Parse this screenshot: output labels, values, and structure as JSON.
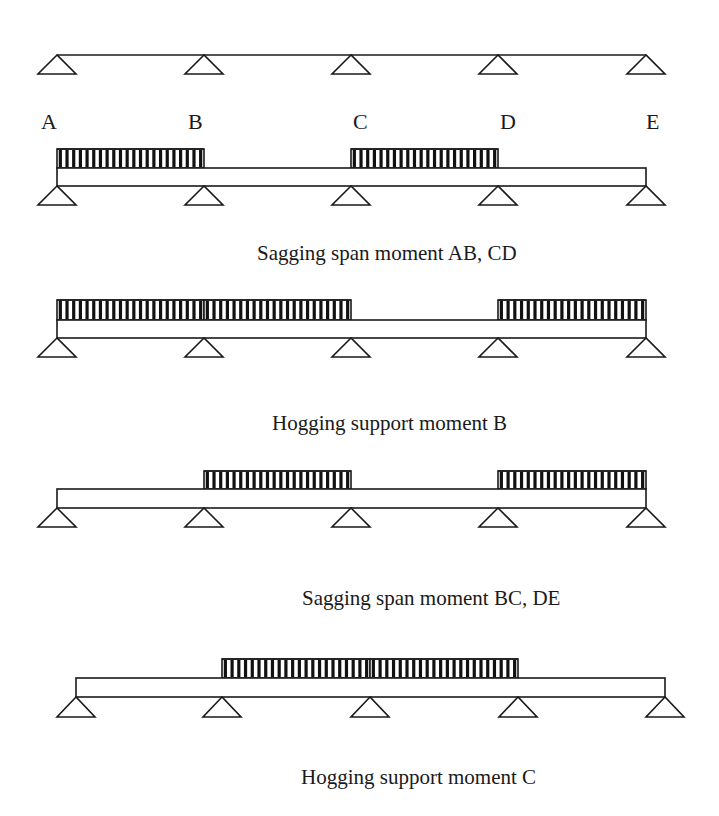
{
  "figure": {
    "width": 719,
    "height": 816,
    "line_color": "#1a1a1a",
    "background": "#ffffff"
  },
  "reference_beam": {
    "y": 55,
    "x_start": 57,
    "x_end": 646,
    "supports_x": [
      57,
      204,
      351,
      498,
      646
    ],
    "support_height": 19,
    "support_half_base": 19
  },
  "node_labels": [
    {
      "text": "A",
      "x": 41,
      "y": 129
    },
    {
      "text": "B",
      "x": 188,
      "y": 129
    },
    {
      "text": "C",
      "x": 353,
      "y": 129
    },
    {
      "text": "D",
      "x": 500,
      "y": 129
    },
    {
      "text": "E",
      "x": 646,
      "y": 129
    }
  ],
  "load_cases": [
    {
      "name": "sagging-AB-CD",
      "caption": "Sagging span moment AB, CD",
      "caption_x": 257,
      "caption_y": 260,
      "beam": {
        "x_start": 57,
        "x_end": 646,
        "y_top": 168,
        "y_bottom": 186
      },
      "load_top": 149,
      "supports_x": [
        57,
        204,
        351,
        498,
        646
      ],
      "support_height": 19,
      "support_half_base": 19,
      "loaded_spans": [
        {
          "span": "AB",
          "x_start": 57,
          "x_end": 204
        },
        {
          "span": "CD",
          "x_start": 351,
          "x_end": 498
        }
      ]
    },
    {
      "name": "hogging-B",
      "caption": "Hogging support moment B",
      "caption_x": 272,
      "caption_y": 430,
      "beam": {
        "x_start": 57,
        "x_end": 646,
        "y_top": 320,
        "y_bottom": 338
      },
      "load_top": 300,
      "supports_x": [
        57,
        204,
        351,
        498,
        646
      ],
      "support_height": 19,
      "support_half_base": 19,
      "loaded_spans": [
        {
          "span": "AB",
          "x_start": 57,
          "x_end": 204
        },
        {
          "span": "BC",
          "x_start": 204,
          "x_end": 351
        },
        {
          "span": "DE",
          "x_start": 498,
          "x_end": 646
        }
      ]
    },
    {
      "name": "sagging-BC-DE",
      "caption": "Sagging span moment BC, DE",
      "caption_x": 302,
      "caption_y": 605,
      "beam": {
        "x_start": 57,
        "x_end": 646,
        "y_top": 489,
        "y_bottom": 508
      },
      "load_top": 471,
      "supports_x": [
        57,
        204,
        351,
        498,
        646
      ],
      "support_height": 19,
      "support_half_base": 19,
      "loaded_spans": [
        {
          "span": "BC",
          "x_start": 204,
          "x_end": 351
        },
        {
          "span": "DE",
          "x_start": 498,
          "x_end": 646
        }
      ]
    },
    {
      "name": "hogging-C",
      "caption": "Hogging support moment C",
      "caption_x": 301,
      "caption_y": 784,
      "beam": {
        "x_start": 76,
        "x_end": 665,
        "y_top": 678,
        "y_bottom": 697
      },
      "load_top": 659,
      "supports_x": [
        76,
        222,
        370,
        518,
        665
      ],
      "support_height": 20,
      "support_half_base": 19,
      "loaded_spans": [
        {
          "span": "BC",
          "x_start": 222,
          "x_end": 370
        },
        {
          "span": "CD",
          "x_start": 370,
          "x_end": 518
        }
      ]
    }
  ],
  "hatch": {
    "pitch": 6.7,
    "bar_width": 3.2
  },
  "icons": {
    "support": "pin-support-triangle-icon",
    "load": "uniformly-distributed-load-hatch"
  }
}
